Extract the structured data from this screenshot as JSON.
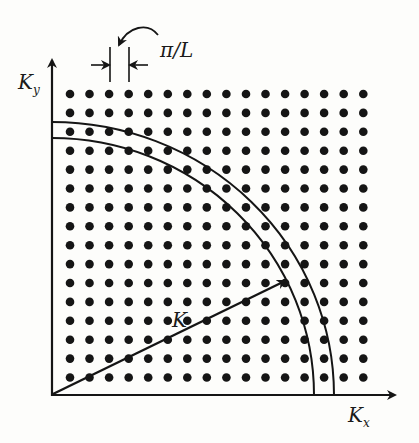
{
  "diagram": {
    "axes": {
      "x_label": "K",
      "x_sub": "x",
      "y_label": "K",
      "y_sub": "y"
    },
    "spacing_label": "π/L",
    "vector_label": "K",
    "grid": {
      "cols": 16,
      "rows": 16,
      "x0": 70,
      "y0": 94,
      "dx": 19.55,
      "dy": 18.9,
      "dot_radius": 4.3
    },
    "colors": {
      "ink": "#151515",
      "background": "#fdfdfb"
    }
  }
}
